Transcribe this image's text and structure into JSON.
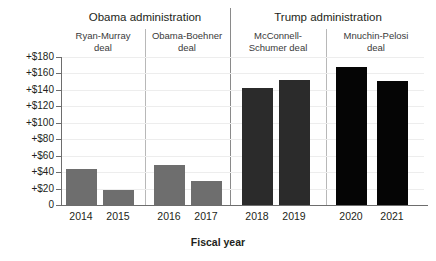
{
  "chart_data": {
    "type": "bar",
    "title": "",
    "xlabel": "Fiscal year",
    "ylabel": "",
    "categories": [
      "2014",
      "2015",
      "2016",
      "2017",
      "2018",
      "2019",
      "2020",
      "2021"
    ],
    "values": [
      44,
      18,
      49,
      29,
      142,
      152,
      168,
      151
    ],
    "ylim": [
      0,
      180
    ],
    "ytick_labels": [
      "0",
      "+$20",
      "+$40",
      "+$60",
      "+$80",
      "+$100",
      "+$120",
      "+$140",
      "+$160",
      "+$180"
    ],
    "ytick_values": [
      0,
      20,
      40,
      60,
      80,
      100,
      120,
      140,
      160,
      180
    ],
    "grid": true,
    "legend": "none",
    "bar_colors": [
      "#6e6e6e",
      "#6e6e6e",
      "#6e6e6e",
      "#6e6e6e",
      "#2b2b2b",
      "#2b2b2b",
      "#050505",
      "#050505"
    ],
    "groups": {
      "administrations": [
        {
          "label": "Obama administration",
          "categories": [
            "2014",
            "2015",
            "2016",
            "2017"
          ]
        },
        {
          "label": "Trump administration",
          "categories": [
            "2018",
            "2019",
            "2020",
            "2021"
          ]
        }
      ],
      "deals": [
        {
          "label": "Ryan-Murray deal",
          "line1": "Ryan-Murray",
          "line2": "deal",
          "categories": [
            "2014",
            "2015"
          ]
        },
        {
          "label": "Obama-Boehner deal",
          "line1": "Obama-Boehner",
          "line2": "deal",
          "categories": [
            "2016",
            "2017"
          ]
        },
        {
          "label": "McConnell-Schumer deal",
          "line1": "McConnell-",
          "line2": "Schumer deal",
          "categories": [
            "2018",
            "2019"
          ]
        },
        {
          "label": "Mnuchin-Pelosi deal",
          "line1": "Mnuchin-Pelosi",
          "line2": "deal",
          "categories": [
            "2020",
            "2021"
          ]
        }
      ]
    }
  },
  "colors": {
    "axis": "#6d6d6d",
    "grid": "#ededed",
    "text": "#231f20",
    "separator_admin": "#8a8a8a",
    "separator_deal": "#b8b8b8"
  }
}
